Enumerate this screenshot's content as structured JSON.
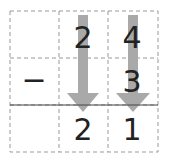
{
  "problem": {
    "operator": "−",
    "minuend": {
      "tens": "2",
      "ones": "4"
    },
    "subtrahend": {
      "ones": "3"
    },
    "result": {
      "tens": "2",
      "ones": "1"
    }
  },
  "colors": {
    "grid": "#999999",
    "arrow": "#a9a9a9",
    "rule": "#444444",
    "text": "#222222"
  }
}
